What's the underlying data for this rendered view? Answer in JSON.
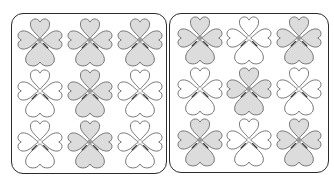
{
  "colors": {
    "shaded_fill": "#dcdcdc",
    "unshaded_fill": "#ffffff",
    "outline": "#6a6a6a",
    "outline_dark": "#3a3a3a",
    "center_shaded": "#9a9a9a",
    "center_unshaded": "#ffffff",
    "panel_border": "#2b2b2b"
  },
  "panels": [
    {
      "name": "left-panel",
      "box": {
        "x": 11,
        "y": 13,
        "w": 156,
        "h": 161
      },
      "col_centers": [
        40,
        90,
        140
      ],
      "row_centers": [
        40,
        91,
        142
      ],
      "grid": [
        [
          "shaded",
          "shaded",
          "shaded"
        ],
        [
          "unshaded",
          "shaded",
          "unshaded"
        ],
        [
          "unshaded",
          "shaded",
          "unshaded"
        ]
      ]
    },
    {
      "name": "right-panel",
      "box": {
        "x": 169,
        "y": 13,
        "w": 160,
        "h": 160
      },
      "col_centers": [
        200,
        249,
        299
      ],
      "row_centers": [
        38,
        89,
        140
      ],
      "grid": [
        [
          "shaded",
          "unshaded",
          "shaded"
        ],
        [
          "unshaded",
          "shaded",
          "unshaded"
        ],
        [
          "shaded",
          "unshaded",
          "shaded"
        ]
      ]
    }
  ]
}
